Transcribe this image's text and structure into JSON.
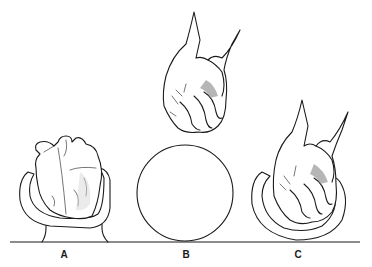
{
  "figure": {
    "panels": [
      {
        "id": "A",
        "label": "A",
        "subject": "heart-in-cup",
        "label_x": 64
      },
      {
        "id": "B",
        "label": "B",
        "subject": "fist-above-sphere",
        "label_x": 186
      },
      {
        "id": "C",
        "label": "C",
        "subject": "fist-in-cup",
        "label_x": 298
      }
    ],
    "colors": {
      "line": "#1a1a1a",
      "background": "#ffffff",
      "shade": "#9a9a9a"
    }
  }
}
